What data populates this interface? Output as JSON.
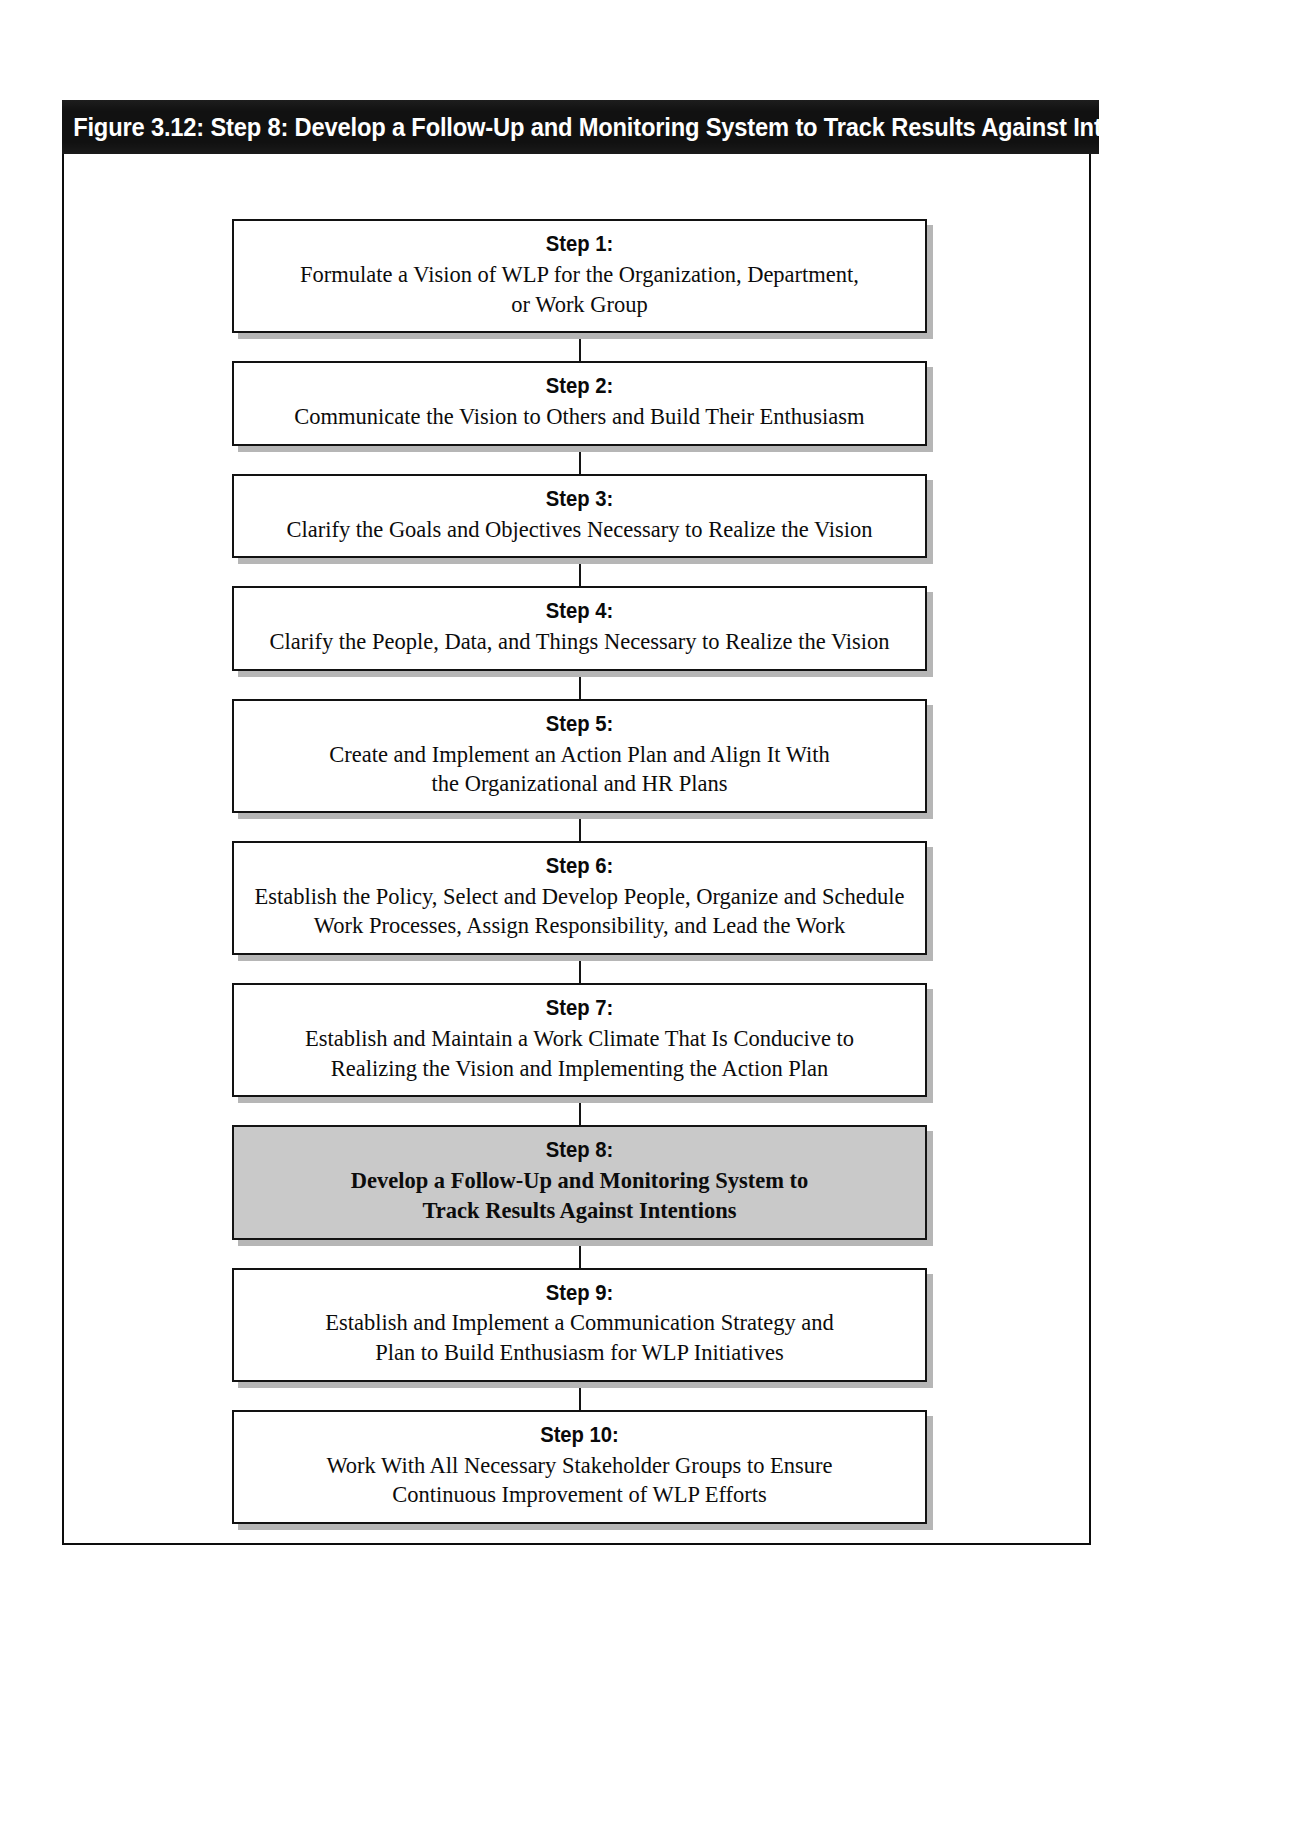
{
  "figure": {
    "banner_title": "Figure 3.12: Step 8: Develop a Follow-Up and Monitoring System to Track Results Against Intentions",
    "highlight_color": "#c9c9c9",
    "banner_color": "#111111",
    "border_color": "#121212"
  },
  "flow": {
    "steps": [
      {
        "label": "Step 1:",
        "body": "Formulate a Vision of WLP for the Organization, Department,\nor Work Group",
        "highlighted": false
      },
      {
        "label": "Step 2:",
        "body": "Communicate the Vision to Others and Build Their Enthusiasm",
        "highlighted": false
      },
      {
        "label": "Step 3:",
        "body": "Clarify the Goals and Objectives Necessary to Realize the Vision",
        "highlighted": false
      },
      {
        "label": "Step 4:",
        "body": "Clarify the People, Data, and Things Necessary to Realize the Vision",
        "highlighted": false
      },
      {
        "label": "Step 5:",
        "body": "Create and Implement an Action Plan and Align It With\nthe Organizational and HR Plans",
        "highlighted": false
      },
      {
        "label": "Step 6:",
        "body": "Establish the Policy, Select and Develop People, Organize and Schedule\nWork Processes, Assign Responsibility, and Lead the Work",
        "highlighted": false
      },
      {
        "label": "Step 7:",
        "body": "Establish and Maintain a Work Climate That Is Conducive to\nRealizing the Vision and Implementing the Action Plan",
        "highlighted": false
      },
      {
        "label": "Step 8:",
        "body": "Develop a Follow-Up and Monitoring System to\nTrack Results Against Intentions",
        "highlighted": true
      },
      {
        "label": "Step 9:",
        "body": "Establish and Implement a Communication Strategy and\nPlan to Build Enthusiasm for WLP Initiatives",
        "highlighted": false
      },
      {
        "label": "Step 10:",
        "body": "Work With All Necessary Stakeholder Groups to Ensure\nContinuous Improvement of WLP Efforts",
        "highlighted": false
      }
    ]
  }
}
